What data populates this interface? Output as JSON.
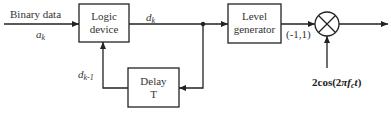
{
  "diagram": {
    "title": "",
    "input": {
      "label": "Binary data",
      "symbol": "a",
      "symbol_sub": "k"
    },
    "blocks": [
      {
        "id": "logic",
        "line1": "Logic",
        "line2": "device"
      },
      {
        "id": "level",
        "line1": "Level",
        "line2": "generator"
      },
      {
        "id": "delay",
        "line1": "Delay",
        "line2": "T"
      }
    ],
    "signals": {
      "dk": {
        "symbol": "d",
        "sub": "k"
      },
      "dk1": {
        "symbol": "d",
        "sub": "k-1"
      },
      "level_out": "(-1,1)",
      "carrier": {
        "prefix": "2cos(2",
        "pi": "π",
        "f": "f",
        "f_sub": "c",
        "t": "t",
        "suffix": ")"
      }
    },
    "multiplier": {
      "symbol": "multiply-circle"
    },
    "colors": {
      "line": "#222222",
      "background": "#ffffff"
    }
  }
}
